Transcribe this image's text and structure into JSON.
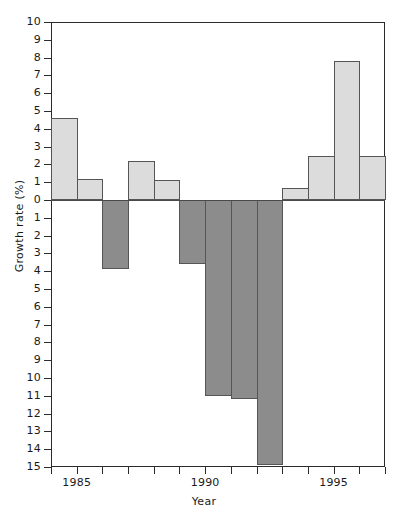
{
  "chart_data": {
    "type": "bar",
    "title": "",
    "xlabel": "Year",
    "ylabel": "Growth rate (%)",
    "categories": [
      1984,
      1985,
      1986,
      1987,
      1988,
      1989,
      1990,
      1991,
      1992,
      1993,
      1994,
      1995,
      1996
    ],
    "values": [
      4.6,
      1.2,
      -3.9,
      2.2,
      1.1,
      -3.6,
      -11.0,
      -11.2,
      -14.9,
      0.7,
      2.5,
      7.8,
      2.5
    ],
    "xlim": [
      1984,
      1997
    ],
    "ylim": [
      -15,
      10
    ],
    "ytick_values": [
      10,
      9,
      8,
      7,
      6,
      5,
      4,
      3,
      2,
      1,
      0,
      -1,
      -2,
      -3,
      -4,
      -5,
      -6,
      -7,
      -8,
      -9,
      -10,
      -11,
      -12,
      -13,
      -14,
      -15
    ],
    "ytick_labels": [
      "10",
      "9",
      "8",
      "7",
      "6",
      "5",
      "4",
      "3",
      "2",
      "1",
      "0",
      "1",
      "2",
      "3",
      "4",
      "5",
      "6",
      "7",
      "8",
      "9",
      "10",
      "11",
      "12",
      "13",
      "14",
      "15"
    ],
    "xtick_values": [
      1984,
      1985,
      1986,
      1987,
      1988,
      1989,
      1990,
      1991,
      1992,
      1993,
      1994,
      1995,
      1996,
      1997
    ],
    "xtick_labels": [
      "",
      "1985",
      "",
      "",
      "",
      "",
      "1990",
      "",
      "",
      "",
      "",
      "1995",
      "",
      ""
    ],
    "grid": false,
    "legend": null,
    "colors": {
      "positive_fill": "#dcdcdc",
      "negative_fill": "#8c8c8c",
      "bar_edge": "#555555",
      "axis": "#2b2b2b",
      "background": "#ffffff"
    },
    "bar_style": "contiguous-histogram"
  }
}
